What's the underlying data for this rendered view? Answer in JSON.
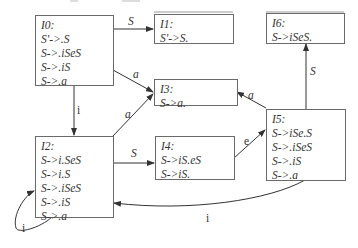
{
  "diagram": {
    "type": "LR(0) item-set automaton",
    "states": [
      {
        "id": "I0",
        "title": "I0:",
        "items": [
          "S'->.S",
          "S->.iSeS",
          "S->.iS",
          "S->.a"
        ]
      },
      {
        "id": "I1",
        "title": "I1:",
        "items": [
          "S'->S."
        ]
      },
      {
        "id": "I2",
        "title": "I2:",
        "items": [
          "S->i.SeS",
          "S->i.S",
          "S->.iSeS",
          "S->.iS",
          "S->.a"
        ]
      },
      {
        "id": "I3",
        "title": "I3:",
        "items": [
          "S->a."
        ]
      },
      {
        "id": "I4",
        "title": "I4:",
        "items": [
          "S->iS.eS",
          "S->iS."
        ]
      },
      {
        "id": "I5",
        "title": "I5:",
        "items": [
          "S->iSe.S",
          "S->.iSeS",
          "S->.iS",
          "S->.a"
        ]
      },
      {
        "id": "I6",
        "title": "I6:",
        "items": [
          "S->iSeS."
        ]
      }
    ],
    "transitions": [
      {
        "from": "I0",
        "to": "I1",
        "label": "S"
      },
      {
        "from": "I0",
        "to": "I3",
        "label": "a"
      },
      {
        "from": "I0",
        "to": "I2",
        "label": "i"
      },
      {
        "from": "I2",
        "to": "I3",
        "label": "a"
      },
      {
        "from": "I2",
        "to": "I4",
        "label": "S"
      },
      {
        "from": "I2",
        "to": "I2",
        "label": "i"
      },
      {
        "from": "I4",
        "to": "I5",
        "label": "e"
      },
      {
        "from": "I5",
        "to": "I3",
        "label": "a"
      },
      {
        "from": "I5",
        "to": "I6",
        "label": "S"
      },
      {
        "from": "I5",
        "to": "I2",
        "label": "i"
      }
    ],
    "caption": ""
  }
}
